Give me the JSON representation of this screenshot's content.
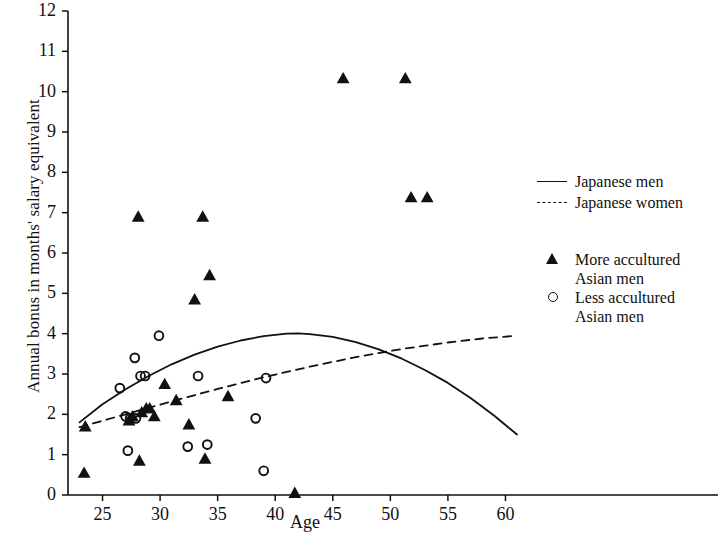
{
  "chart_data": {
    "type": "scatter",
    "title": "",
    "xlabel": "Age",
    "ylabel": "Annual bonus in months' salary equivalent",
    "xlim": [
      22,
      63
    ],
    "ylim": [
      0,
      12
    ],
    "xticks": [
      25,
      30,
      35,
      40,
      45,
      50,
      55,
      60
    ],
    "yticks": [
      0,
      1,
      2,
      3,
      4,
      5,
      6,
      7,
      8,
      9,
      10,
      11,
      12
    ],
    "grid": false,
    "legend_position": "right",
    "series": [
      {
        "name": "Japanese men",
        "marker": "none",
        "line": "solid",
        "type": "curve",
        "points": [
          [
            23.0,
            1.8
          ],
          [
            25.0,
            2.25
          ],
          [
            27.0,
            2.62
          ],
          [
            29.0,
            2.95
          ],
          [
            31.0,
            3.24
          ],
          [
            33.0,
            3.48
          ],
          [
            35.0,
            3.68
          ],
          [
            37.0,
            3.83
          ],
          [
            39.0,
            3.94
          ],
          [
            41.0,
            4.0
          ],
          [
            42.0,
            4.01
          ],
          [
            43.0,
            3.99
          ],
          [
            45.0,
            3.92
          ],
          [
            47.0,
            3.79
          ],
          [
            49.0,
            3.61
          ],
          [
            51.0,
            3.38
          ],
          [
            53.0,
            3.1
          ],
          [
            55.0,
            2.78
          ],
          [
            57.0,
            2.4
          ],
          [
            59.0,
            1.97
          ],
          [
            61.0,
            1.5
          ]
        ]
      },
      {
        "name": "Japanese women",
        "marker": "none",
        "line": "dashed",
        "type": "curve",
        "points": [
          [
            23.0,
            1.68
          ],
          [
            27.0,
            2.0
          ],
          [
            31.0,
            2.32
          ],
          [
            35.0,
            2.63
          ],
          [
            39.0,
            2.92
          ],
          [
            43.0,
            3.18
          ],
          [
            47.0,
            3.42
          ],
          [
            51.0,
            3.62
          ],
          [
            55.0,
            3.78
          ],
          [
            58.0,
            3.88
          ],
          [
            61.0,
            3.95
          ]
        ]
      },
      {
        "name": "More accultured Asian men",
        "legend_label_line1": "More accultured",
        "legend_label_line2": "Asian men",
        "marker": "triangle",
        "line": "none",
        "points": [
          [
            23.4,
            0.55
          ],
          [
            23.5,
            1.7
          ],
          [
            27.3,
            1.85
          ],
          [
            27.6,
            1.95
          ],
          [
            28.1,
            6.9
          ],
          [
            28.2,
            0.85
          ],
          [
            28.4,
            2.05
          ],
          [
            28.8,
            2.15
          ],
          [
            29.1,
            2.15
          ],
          [
            29.5,
            1.95
          ],
          [
            30.4,
            2.75
          ],
          [
            31.4,
            2.35
          ],
          [
            32.5,
            1.75
          ],
          [
            33.0,
            4.85
          ],
          [
            33.7,
            6.9
          ],
          [
            33.9,
            0.9
          ],
          [
            34.3,
            5.45
          ],
          [
            35.9,
            2.45
          ],
          [
            41.7,
            0.05
          ],
          [
            45.9,
            10.33
          ],
          [
            51.3,
            10.33
          ],
          [
            51.8,
            7.38
          ],
          [
            53.2,
            7.38
          ]
        ]
      },
      {
        "name": "Less accultured Asian men",
        "legend_label_line1": "Less accultured",
        "legend_label_line2": "Asian men",
        "marker": "circle",
        "line": "none",
        "points": [
          [
            26.5,
            2.65
          ],
          [
            27.0,
            1.95
          ],
          [
            27.2,
            1.1
          ],
          [
            27.4,
            1.9
          ],
          [
            27.8,
            3.4
          ],
          [
            27.9,
            1.9
          ],
          [
            28.3,
            2.95
          ],
          [
            28.7,
            2.95
          ],
          [
            29.9,
            3.95
          ],
          [
            32.4,
            1.2
          ],
          [
            33.3,
            2.95
          ],
          [
            34.1,
            1.25
          ],
          [
            38.3,
            1.9
          ],
          [
            39.0,
            0.6
          ],
          [
            39.2,
            2.9
          ]
        ]
      }
    ]
  },
  "axes": {
    "x_label": "Age",
    "y_label": "Annual bonus in months' salary equivalent",
    "x_tick_labels": [
      "25",
      "30",
      "35",
      "40",
      "45",
      "50",
      "55",
      "60"
    ],
    "y_tick_labels": [
      "0",
      "1",
      "2",
      "3",
      "4",
      "5",
      "6",
      "7",
      "8",
      "9",
      "10",
      "11",
      "12"
    ]
  },
  "legend": {
    "entries": [
      {
        "key": "solid-line-key",
        "label": "Japanese men",
        "label2": ""
      },
      {
        "key": "dashed-line-key",
        "label": "Japanese women",
        "label2": ""
      },
      {
        "key": "triangle-marker-key",
        "label": "More accultured",
        "label2": "Asian men"
      },
      {
        "key": "circle-marker-key",
        "label": "Less accultured",
        "label2": "Asian men"
      }
    ]
  },
  "colors": {
    "ink": "#111111",
    "background": "#ffffff"
  }
}
